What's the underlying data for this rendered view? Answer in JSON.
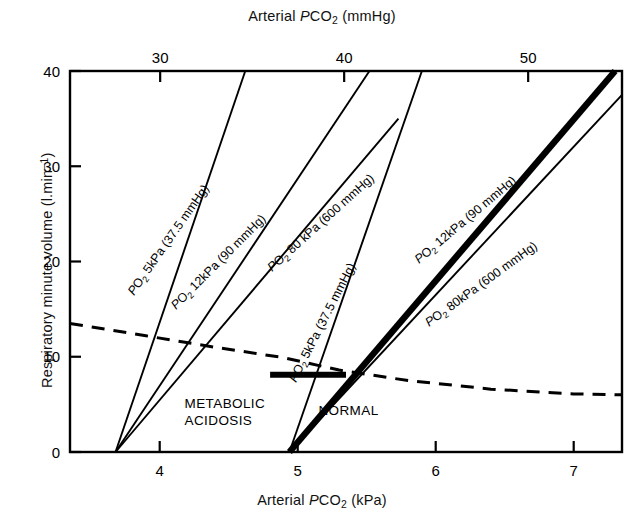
{
  "figure": {
    "top_axis_title_parts": {
      "pre": "Arterial ",
      "italic": "P",
      "small": "CO",
      "sub": "2",
      "post": " (mmHg)"
    },
    "bottom_axis_title_parts": {
      "pre": "Arterial ",
      "italic": "P",
      "small": "CO",
      "sub": "2",
      "post": " (kPa)"
    },
    "y_axis_title_parts": {
      "pre": "Respiratory minute volume (l.min",
      "sup": "−1",
      "post": ")"
    }
  },
  "chart_data": {
    "type": "line",
    "title": "",
    "xlabel": "Arterial PCO2 (kPa)",
    "xlabel_top": "Arterial PCO2 (mmHg)",
    "ylabel": "Respiratory minute volume (l.min-1)",
    "xlim": [
      3.35,
      7.35
    ],
    "ylim": [
      0,
      40
    ],
    "xlim_top_mmHg": [
      25.1,
      55.1
    ],
    "grid": false,
    "legend": "inline-labels",
    "x_ticks": [
      4,
      5,
      6,
      7
    ],
    "x_tick_labels": [
      "4",
      "5",
      "6",
      "7"
    ],
    "x_ticks_top_mmHg": [
      30,
      40,
      50
    ],
    "x_tick_labels_top": [
      "30",
      "40",
      "50"
    ],
    "y_ticks": [
      0,
      10,
      20,
      30,
      40
    ],
    "y_tick_labels": [
      "0",
      "10",
      "20",
      "30",
      "40"
    ],
    "region_labels": [
      {
        "text_line1": "METABOLIC",
        "text_line2": "ACIDOSIS",
        "x": 4.18,
        "y": 4.6
      },
      {
        "text_line1": "NORMAL",
        "text_line2": "",
        "x": 5.15,
        "y": 3.9
      }
    ],
    "series": [
      {
        "name": "metabolic-acidosis-po2-5kpa",
        "label": "PO2 5kPa (37.5 mmHg)",
        "label_parts": {
          "italic": "P",
          "sub": "O",
          "sub2": "2",
          "rest": " 5kPa (37.5 mmHg)"
        },
        "group": "metabolic acidosis",
        "style": "solid-thin",
        "x": [
          3.68,
          4.62
        ],
        "y": [
          0,
          40
        ]
      },
      {
        "name": "metabolic-acidosis-po2-12kpa",
        "label": "PO2 12kPa (90 mmHg)",
        "label_parts": {
          "italic": "P",
          "sub": "O",
          "sub2": "2",
          "rest": " 12kPa (90 mmHg)"
        },
        "group": "metabolic acidosis",
        "style": "solid-thin",
        "x": [
          3.68,
          5.52
        ],
        "y": [
          0,
          40
        ]
      },
      {
        "name": "metabolic-acidosis-po2-80kpa",
        "label": "PO2 80 kPa (600 mmHg)",
        "label_parts": {
          "italic": "P",
          "sub": "O",
          "sub2": "2",
          "rest": " 80 kPa (600 mmHg)"
        },
        "group": "metabolic acidosis",
        "style": "solid-thin",
        "x": [
          3.68,
          5.73
        ],
        "y": [
          0,
          35
        ]
      },
      {
        "name": "normal-po2-5kpa",
        "label": "PO2 5kPa (37.5 mmHg)",
        "label_parts": {
          "italic": "P",
          "sub": "O",
          "sub2": "2",
          "rest": " 5kPa (37.5 mmHg)"
        },
        "group": "normal",
        "style": "solid-thin",
        "x": [
          4.94,
          5.9
        ],
        "y": [
          0,
          40
        ]
      },
      {
        "name": "normal-po2-12kpa",
        "label": "PO2 12kPa (90 mmHg)",
        "label_parts": {
          "italic": "P",
          "sub": "O",
          "sub2": "2",
          "rest": " 12kPa (90 mmHg)"
        },
        "group": "normal",
        "style": "solid-bold",
        "x": [
          4.94,
          7.3
        ],
        "y": [
          0,
          40
        ]
      },
      {
        "name": "normal-po2-80kpa",
        "label": "PO2 80kPa (600 mmHg)",
        "label_parts": {
          "italic": "P",
          "sub": "O",
          "sub2": "2",
          "rest": " 80kPa (600 mmHg)"
        },
        "group": "normal",
        "style": "solid-thin",
        "x": [
          4.94,
          7.35
        ],
        "y": [
          0,
          37.5
        ]
      },
      {
        "name": "oxygen-cost-of-breathing-dashed",
        "label": "",
        "group": "dashed",
        "style": "dashed",
        "x": [
          3.35,
          3.9,
          4.4,
          4.9,
          5.3,
          5.8,
          6.4,
          7.0,
          7.35
        ],
        "y": [
          13.5,
          12.2,
          11.0,
          9.9,
          8.6,
          7.5,
          6.6,
          6.1,
          6.0
        ]
      },
      {
        "name": "resting-ventilation-marker",
        "label": "",
        "group": "marker",
        "style": "solid-bold-horizontal",
        "x": [
          4.8,
          5.35
        ],
        "y": [
          8.1,
          8.1
        ]
      }
    ]
  }
}
